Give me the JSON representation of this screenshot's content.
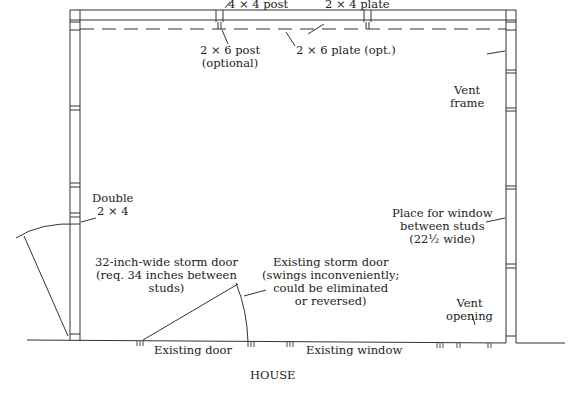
{
  "diagram": {
    "colors": {
      "line": "#333333",
      "text": "#222222",
      "background": "#ffffff"
    },
    "labels": {
      "post_4x4": "4 × 4 post",
      "plate_2x4": "2 × 4 plate",
      "post_2x6": [
        "2 × 6 post",
        "(optional)"
      ],
      "plate_2x6": "2 × 6 plate (opt.)",
      "vent_frame": [
        "Vent",
        "frame"
      ],
      "double_2x4": [
        "Double",
        "2 × 4"
      ],
      "window_place": [
        "Place for window",
        "between studs",
        "(22½ wide)"
      ],
      "new_storm_door": [
        "32-inch-wide storm door",
        "(req. 34 inches between",
        "studs)"
      ],
      "existing_storm_door": [
        "Existing storm door",
        "(swings inconveniently;",
        "could be eliminated",
        "or reversed)"
      ],
      "vent_opening": [
        "Vent",
        "opening"
      ],
      "existing_door": "Existing door",
      "existing_window": "Existing window",
      "house": "HOUSE"
    }
  }
}
